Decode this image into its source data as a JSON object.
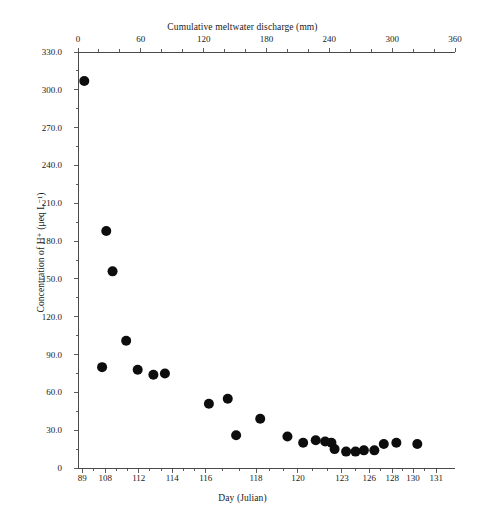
{
  "chart_data": {
    "type": "scatter",
    "title": "",
    "xlabel": "Day (Julian)",
    "ylabel": "Concentration of H⁺ (μeq L⁻¹)",
    "x2label": "Cumulative meltwater discharge (mm)",
    "ylim": [
      0,
      330
    ],
    "xlim": [
      0,
      360
    ],
    "grid": false,
    "legend": null,
    "y_ticks": [
      "0",
      "30.0",
      "60.0",
      "90.0",
      "120.0",
      "150.0",
      "180.0",
      "210.0",
      "240.0",
      "270.0",
      "300.0",
      "330.0"
    ],
    "y_tick_values": [
      0,
      30,
      60,
      90,
      120,
      150,
      180,
      210,
      240,
      270,
      300,
      330
    ],
    "top_x_ticks": [
      "0",
      "60",
      "120",
      "180",
      "240",
      "300",
      "360"
    ],
    "top_x_tick_values": [
      0,
      60,
      120,
      180,
      240,
      300,
      360
    ],
    "bottom_x_ticks": [
      "89",
      "108",
      "112",
      "114",
      "116",
      "118",
      "120",
      "123",
      "126",
      "128",
      "130",
      "131"
    ],
    "bottom_x_tick_positions": [
      4,
      26,
      58,
      90,
      122,
      170,
      210,
      252,
      278,
      300,
      320,
      342
    ],
    "marker_color": "#0d0d0d",
    "marker_size": 6,
    "points": [
      {
        "x": 6,
        "y": 307
      },
      {
        "x": 27,
        "y": 188
      },
      {
        "x": 33,
        "y": 156
      },
      {
        "x": 46,
        "y": 101
      },
      {
        "x": 23,
        "y": 80
      },
      {
        "x": 57,
        "y": 78
      },
      {
        "x": 72,
        "y": 74
      },
      {
        "x": 83,
        "y": 75
      },
      {
        "x": 125,
        "y": 51
      },
      {
        "x": 143,
        "y": 55
      },
      {
        "x": 151,
        "y": 26
      },
      {
        "x": 174,
        "y": 39
      },
      {
        "x": 200,
        "y": 25
      },
      {
        "x": 215,
        "y": 20
      },
      {
        "x": 227,
        "y": 22
      },
      {
        "x": 236,
        "y": 21
      },
      {
        "x": 242,
        "y": 20
      },
      {
        "x": 245,
        "y": 15
      },
      {
        "x": 256,
        "y": 13
      },
      {
        "x": 265,
        "y": 13
      },
      {
        "x": 273,
        "y": 14
      },
      {
        "x": 283,
        "y": 14
      },
      {
        "x": 292,
        "y": 19
      },
      {
        "x": 304,
        "y": 20
      },
      {
        "x": 324,
        "y": 19
      }
    ]
  }
}
